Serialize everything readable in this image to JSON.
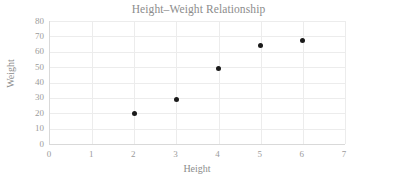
{
  "chart_data": {
    "type": "scatter",
    "title": "Height–Weight Relationship",
    "xlabel": "Height",
    "ylabel": "Weight",
    "x": [
      2,
      3,
      4,
      5,
      6
    ],
    "values": [
      20,
      29,
      49,
      64,
      67
    ],
    "points": [
      {
        "x": 2,
        "y": 20
      },
      {
        "x": 3,
        "y": 29
      },
      {
        "x": 4,
        "y": 49
      },
      {
        "x": 5,
        "y": 64
      },
      {
        "x": 6,
        "y": 67
      }
    ],
    "xlim": [
      0,
      7
    ],
    "ylim": [
      0,
      80
    ],
    "xticks": [
      0,
      1,
      2,
      3,
      4,
      5,
      6,
      7
    ],
    "yticks": [
      0,
      10,
      20,
      30,
      40,
      50,
      60,
      70,
      80
    ],
    "grid": true,
    "legend": false,
    "marker_color": "#1a1a1a",
    "gridline_color": "#ececec",
    "axis_color": "#d9d9d9",
    "text_color": "#9b9b9b",
    "title_color": "#8c8c8c",
    "background_color": "#ffffff"
  }
}
